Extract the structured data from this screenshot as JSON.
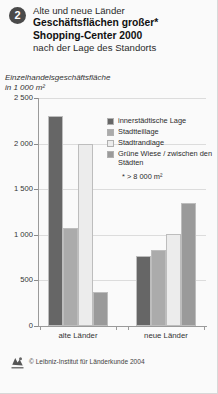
{
  "header": {
    "badge": "2",
    "line1": "Alte und neue Länder",
    "line2": "Geschäftsflächen großer*",
    "line3": "Shopping-Center 2000",
    "line4": "nach der Lage des Standorts"
  },
  "axis_caption": {
    "line1": "Einzelhandelsgeschäftsfläche",
    "line2": "in 1 000 m²"
  },
  "legend": {
    "items": [
      {
        "label": "innerstädtische Lage",
        "color": "#666666"
      },
      {
        "label": "Stadtteillage",
        "color": "#ababab"
      },
      {
        "label": "Stadtrandlage",
        "color": "#ececec"
      },
      {
        "label": "Grüne Wiese / zwischen den Städten",
        "color": "#9a9a9a"
      }
    ],
    "note": "* > 8 000 m²"
  },
  "footer": {
    "copyright": "© Leibniz-Institut für Länderkunde 2004",
    "logo_icon": "ifl-logo-icon"
  },
  "chart_data": {
    "type": "bar",
    "title": "Geschäftsflächen großer* Shopping-Center 2000 nach der Lage des Standorts",
    "subtitle": "Alte und neue Länder",
    "xlabel": "",
    "ylabel": "Einzelhandelsgeschäftsfläche in 1 000 m²",
    "ylim": [
      0,
      2500
    ],
    "yticks": [
      0,
      500,
      1000,
      1500,
      2000,
      2500
    ],
    "ytick_labels": [
      "0",
      "500",
      "1 000",
      "1 500",
      "2 000",
      "2 500"
    ],
    "grid": true,
    "legend_position": "inside-top-right",
    "categories": [
      "alte Länder",
      "neue Länder"
    ],
    "series": [
      {
        "name": "innerstädtische Lage",
        "color": "#666666",
        "values": [
          2300,
          770
        ]
      },
      {
        "name": "Stadtteillage",
        "color": "#ababab",
        "values": [
          1070,
          830
        ]
      },
      {
        "name": "Stadtrandlage",
        "color": "#ececec",
        "values": [
          2000,
          1010
        ]
      },
      {
        "name": "Grüne Wiese / zwischen den Städten",
        "color": "#9a9a9a",
        "values": [
          370,
          1350
        ]
      }
    ]
  }
}
